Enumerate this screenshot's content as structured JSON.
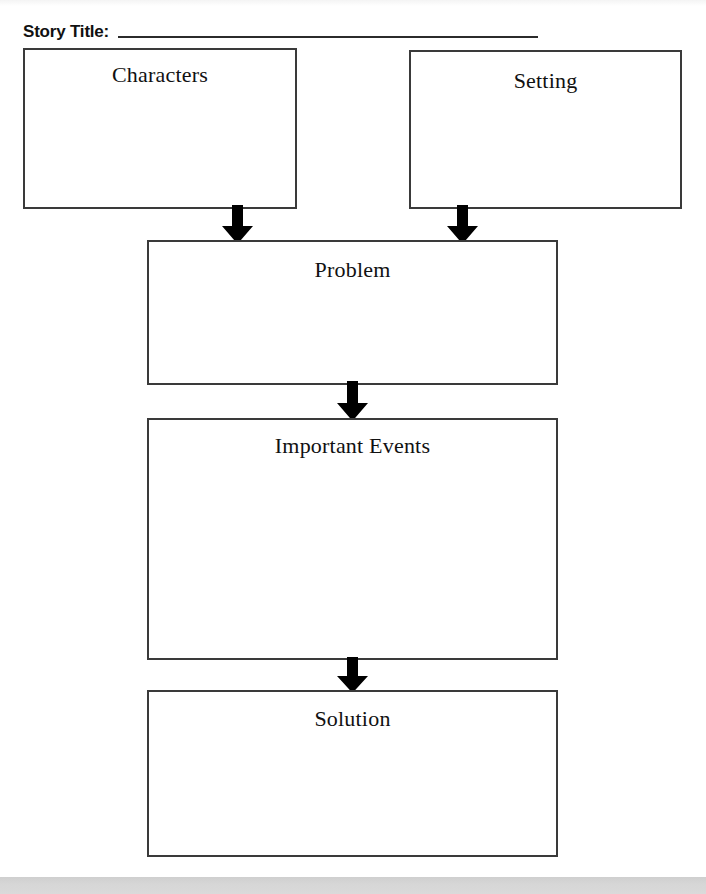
{
  "worksheet": {
    "header": {
      "label": "Story Title:",
      "rule_name": "title-write-in-line"
    },
    "boxes": [
      {
        "id": "characters",
        "label": "Characters"
      },
      {
        "id": "setting",
        "label": "Setting"
      },
      {
        "id": "problem",
        "label": "Problem"
      },
      {
        "id": "events",
        "label": "Important Events"
      },
      {
        "id": "solution",
        "label": "Solution"
      }
    ],
    "arrows": [
      {
        "id": "characters-to-problem",
        "direction": "down"
      },
      {
        "id": "setting-to-problem",
        "direction": "down"
      },
      {
        "id": "problem-to-events",
        "direction": "down"
      },
      {
        "id": "events-to-solution",
        "direction": "down"
      }
    ],
    "colors": {
      "ink": "#111111",
      "box_border": "#3a3a3a",
      "rule": "#2b2b2b",
      "arrow_fill": "#000000",
      "paper": "#ffffff",
      "page_edge": "#d6d6d6"
    }
  }
}
